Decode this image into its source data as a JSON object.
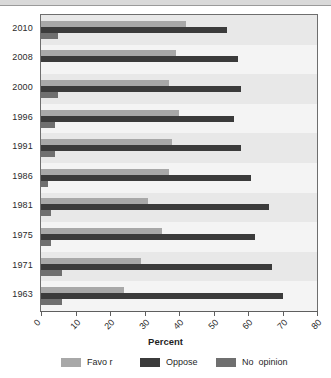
{
  "chart_data": {
    "type": "bar",
    "orientation": "horizontal",
    "title": "",
    "xlabel": "Percent",
    "ylabel": "",
    "xlim": [
      0,
      80
    ],
    "xticks": [
      0,
      10,
      20,
      30,
      40,
      50,
      60,
      70,
      80
    ],
    "xtick_labels": [
      "0",
      "10",
      "20",
      "30",
      "40",
      "50",
      "60",
      "70",
      "80"
    ],
    "grid": false,
    "legend_position": "bottom",
    "categories": [
      "2010",
      "2008",
      "2000",
      "1996",
      "1991",
      "1986",
      "1981",
      "1975",
      "1971",
      "1963"
    ],
    "series": [
      {
        "name": "Favo r",
        "color": "#a8a8a8",
        "values": [
          42,
          39,
          37,
          40,
          38,
          37,
          31,
          35,
          29,
          24
        ]
      },
      {
        "name": "Oppose",
        "color": "#3b3b3b",
        "values": [
          54,
          57,
          58,
          56,
          58,
          61,
          66,
          62,
          67,
          70
        ]
      },
      {
        "name": "No  opinion",
        "color": "#6f6f6f",
        "values": [
          5,
          0,
          5,
          4,
          4,
          2,
          3,
          3,
          6,
          6
        ]
      }
    ]
  },
  "axis": {
    "x_title": "Percent"
  },
  "legend": {
    "items": [
      {
        "label": "Favo r",
        "color": "#a8a8a8",
        "swatch": "favor"
      },
      {
        "label": "Oppose",
        "color": "#3b3b3b",
        "swatch": "oppose"
      },
      {
        "label": "No  opinion",
        "color": "#6f6f6f",
        "swatch": "noop"
      }
    ]
  },
  "colors": {
    "favor": "#a8a8a8",
    "oppose": "#3b3b3b",
    "no_opinion": "#6f6f6f",
    "plot_background": "#f2f2f2",
    "band_shade": "#e8e8e8",
    "frame": "#6e6e6e",
    "text": "#2b2b2b"
  }
}
